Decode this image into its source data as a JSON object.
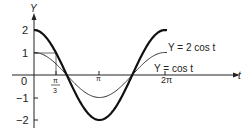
{
  "chart_data": {
    "type": "line",
    "title": "",
    "xlabel": "t",
    "ylabel": "Y",
    "x_ticks": [
      "π/3",
      "π",
      "2π"
    ],
    "y_ticks": [
      "2",
      "1",
      "0",
      "−1",
      "−2"
    ],
    "ylim": [
      -2,
      2
    ],
    "xlim": [
      0,
      6.2832
    ],
    "grid": false,
    "series": [
      {
        "name": "Y = 2 cos t",
        "amplitude": 2,
        "stroke": "#111111",
        "width": 2.2,
        "x": [
          0,
          1.0472,
          1.5708,
          3.1416,
          4.7124,
          6.2832
        ],
        "values": [
          2,
          1,
          0,
          -2,
          0,
          2
        ]
      },
      {
        "name": "Y = cos t",
        "amplitude": 1,
        "stroke": "#333333",
        "width": 1,
        "x": [
          0,
          1.0472,
          1.5708,
          3.1416,
          4.7124,
          6.2832
        ],
        "values": [
          1,
          0.5,
          0,
          -1,
          0,
          1
        ]
      }
    ],
    "annotations": [
      {
        "text": "dashed guide from (0,1) to (π/3,1) down to axis"
      }
    ]
  },
  "labels": {
    "y_axis": "Y",
    "x_axis": "t",
    "origin": "0",
    "y2": "2",
    "y1": "1",
    "ym1": "−1",
    "ym2": "−2",
    "pi": "π",
    "two_pi": "2π",
    "pi3_num": "π",
    "pi3_den": "3",
    "legend_2cos": "Y = 2 cos t",
    "legend_cos": "Y =  cos t"
  }
}
